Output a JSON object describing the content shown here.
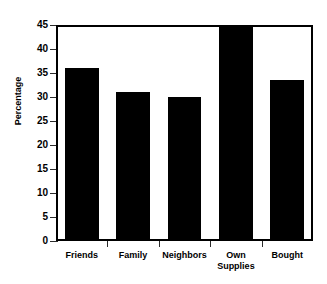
{
  "chart_data": {
    "type": "bar",
    "title": "",
    "title_remnant": "",
    "xlabel": "",
    "ylabel": "Percentage",
    "categories": [
      "Friends",
      "Family",
      "Neighbors",
      "Own Supplies",
      "Bought"
    ],
    "category_lines": [
      [
        "Friends"
      ],
      [
        "Family"
      ],
      [
        "Neighbors"
      ],
      [
        "Own",
        "Supplies"
      ],
      [
        "Bought"
      ]
    ],
    "values": [
      36,
      31,
      30,
      44.7,
      33.6
    ],
    "ylim": [
      0,
      45
    ],
    "yticks": [
      0,
      5,
      10,
      15,
      20,
      25,
      30,
      35,
      40,
      45
    ],
    "ytick_labels": [
      "0",
      "5",
      "10",
      "15",
      "20",
      "25",
      "30",
      "35",
      "40",
      "45"
    ],
    "grid": false,
    "legend": false,
    "bar_color": "#000000",
    "axis_color": "#000000",
    "background_color": "#ffffff"
  },
  "axes": {
    "y_title": "Percentage"
  }
}
